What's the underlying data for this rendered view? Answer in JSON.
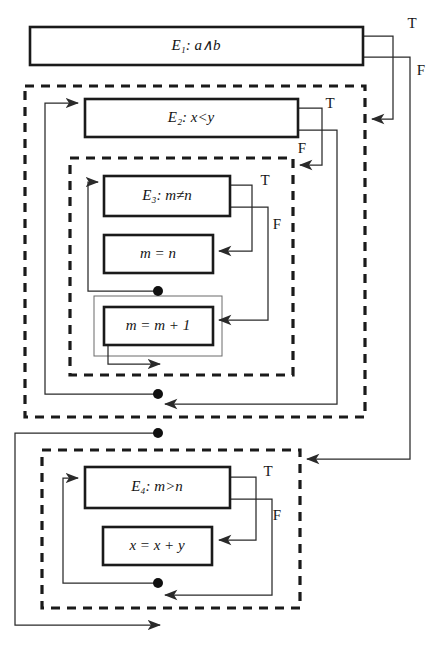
{
  "diagram": {
    "type": "control-flow-graph",
    "title": "",
    "branch_labels": {
      "true": "T",
      "false": "F"
    },
    "nodes": [
      {
        "id": "E1",
        "kind": "condition",
        "label_prefix": "E",
        "label_subscript": "1",
        "label_separator": ":",
        "expression": "a∧b",
        "full_label": "E₁:  a∧b",
        "x": 30,
        "y": 27,
        "w": 333,
        "h": 38
      },
      {
        "id": "E2",
        "kind": "condition",
        "label_prefix": "E",
        "label_subscript": "2",
        "label_separator": ":",
        "expression": "x<y",
        "full_label": "E₂:  x<y",
        "x": 85,
        "y": 99,
        "w": 213,
        "h": 38
      },
      {
        "id": "E3",
        "kind": "condition",
        "label_prefix": "E",
        "label_subscript": "3",
        "label_separator": ":",
        "expression": "m≠n",
        "full_label": "E₃:  m≠n",
        "x": 104,
        "y": 176,
        "w": 126,
        "h": 40
      },
      {
        "id": "A1",
        "kind": "statement",
        "expression": "m = n",
        "full_label": "m = n",
        "x": 104,
        "y": 235,
        "w": 109,
        "h": 38
      },
      {
        "id": "A2",
        "kind": "statement",
        "expression": "m = m + 1",
        "full_label": "m = m + 1",
        "x": 104,
        "y": 307,
        "w": 109,
        "h": 38
      },
      {
        "id": "E4",
        "kind": "condition",
        "label_prefix": "E",
        "label_subscript": "4",
        "label_separator": ":",
        "expression": "m>n",
        "full_label": "E₄:  m>n",
        "x": 85,
        "y": 467,
        "w": 145,
        "h": 41
      },
      {
        "id": "A3",
        "kind": "statement",
        "expression": "x = x + y",
        "full_label": "x = x + y",
        "x": 103,
        "y": 527,
        "w": 109,
        "h": 38
      }
    ],
    "regions": [
      {
        "id": "loop-outer",
        "style": "dashed",
        "x": 25,
        "y": 86,
        "w": 340,
        "h": 331
      },
      {
        "id": "loop-inner",
        "style": "dashed",
        "x": 70,
        "y": 158,
        "w": 223,
        "h": 217
      },
      {
        "id": "loop-bottom",
        "style": "dashed",
        "x": 42,
        "y": 450,
        "w": 258,
        "h": 158
      },
      {
        "id": "frame-a2",
        "style": "thin",
        "x": 94,
        "y": 296,
        "w": 128,
        "h": 60
      }
    ],
    "branch_annotations": [
      {
        "for": "E1",
        "branch": "T",
        "label": "T",
        "x": 412,
        "y": 25
      },
      {
        "for": "E1",
        "branch": "F",
        "label": "F",
        "x": 421,
        "y": 72
      },
      {
        "for": "E2",
        "branch": "T",
        "label": "T",
        "x": 330,
        "y": 105
      },
      {
        "for": "E2",
        "branch": "F",
        "label": "F",
        "x": 302,
        "y": 150
      },
      {
        "for": "E3",
        "branch": "T",
        "label": "T",
        "x": 265,
        "y": 182
      },
      {
        "for": "E3",
        "branch": "F",
        "label": "F",
        "x": 277,
        "y": 226
      },
      {
        "for": "E4",
        "branch": "T",
        "label": "T",
        "x": 268,
        "y": 473
      },
      {
        "for": "E4",
        "branch": "F",
        "label": "F",
        "x": 277,
        "y": 517
      }
    ],
    "junction_dots": [
      {
        "id": "dot-inner-body",
        "x": 158,
        "y": 291,
        "r": 5
      },
      {
        "id": "dot-outer-body",
        "x": 158,
        "y": 394,
        "r": 5
      },
      {
        "id": "dot-seq-mid",
        "x": 158,
        "y": 433,
        "r": 5
      },
      {
        "id": "dot-bottom-body",
        "x": 158,
        "y": 583,
        "r": 5
      }
    ],
    "edges": [
      {
        "id": "e1-true",
        "from": "E1",
        "to": "loop-outer",
        "branch": "T"
      },
      {
        "id": "e1-false",
        "from": "E1",
        "to": "loop-bottom",
        "branch": "F"
      },
      {
        "id": "e2-true",
        "from": "E2",
        "to": "loop-inner",
        "branch": "T"
      },
      {
        "id": "e2-false",
        "from": "E2",
        "to": "loop-outer-exit",
        "branch": "F"
      },
      {
        "id": "e3-true",
        "from": "E3",
        "to": "A1",
        "branch": "T"
      },
      {
        "id": "e3-false",
        "from": "E3",
        "to": "A2",
        "branch": "F"
      },
      {
        "id": "back-inner",
        "from": "A1",
        "to": "E3",
        "branch": ""
      },
      {
        "id": "back-outer",
        "from": "loop-inner",
        "to": "E2",
        "branch": ""
      },
      {
        "id": "seq-next",
        "from": "loop-outer",
        "to": "loop-bottom",
        "branch": ""
      },
      {
        "id": "e4-true",
        "from": "E4",
        "to": "A3",
        "branch": "T"
      },
      {
        "id": "e4-false",
        "from": "E4",
        "to": "loop-bottom-exit",
        "branch": "F"
      },
      {
        "id": "back-bottom",
        "from": "A3",
        "to": "E4",
        "branch": ""
      },
      {
        "id": "exit",
        "from": "loop-bottom",
        "to": "end",
        "branch": ""
      }
    ]
  }
}
